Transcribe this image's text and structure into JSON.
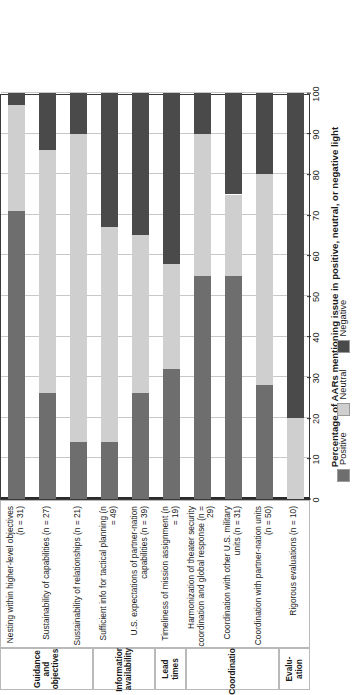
{
  "chart_data": {
    "type": "bar",
    "subtype": "stacked-horizontal-100pct",
    "title": "",
    "xlabel": "Percentage of AARs mentioning issue in positive, neutral, or negative light",
    "ylabel": "",
    "xlim": [
      0,
      100
    ],
    "xticks": [
      0,
      10,
      20,
      30,
      40,
      50,
      60,
      70,
      80,
      90,
      100
    ],
    "grid": true,
    "legend_position": "bottom",
    "categories": [
      "Nesting within higher-level objectives (n = 31)",
      "Sustainability of capabilities (n = 27)",
      "Sustainability of relationships (n = 21)",
      "Sufficient info for tactical planning (n = 49)",
      "U.S. expectations of partner-nation capabilities (n = 39)",
      "Timeliness of mission assignment (n = 19)",
      "Harmonization of theater security coordination and global response (n = 29)",
      "Coordination with other U.S. military units (n = 31)",
      "Coordination with partner-nation units (n = 50)",
      "Rigorous evaluations (n = 10)"
    ],
    "category_lines": [
      [
        "Nesting within higher-level objectives",
        "(n = 31)"
      ],
      [
        "Sustainability of capabilities (n = 27)"
      ],
      [
        "Sustainability of relationships (n = 21)"
      ],
      [
        "Sufficient info for tactical planning (n = 49)"
      ],
      [
        "U.S. expectations of partner-nation",
        "capabilities (n = 39)"
      ],
      [
        "Timeliness of mission assignment (n = 19)"
      ],
      [
        "Harmonization of theater security",
        "coordination and global response (n = 29)"
      ],
      [
        "Coordination with other U.S. military",
        "units (n = 31)"
      ],
      [
        "Coordination with partner-nation units",
        "(n = 50)"
      ],
      [
        "Rigorous evaluations (n = 10)"
      ]
    ],
    "sample_sizes": [
      31,
      27,
      21,
      49,
      39,
      19,
      29,
      31,
      50,
      10
    ],
    "series": [
      {
        "name": "Positive",
        "color": "#6e6e6e",
        "values": [
          71,
          26,
          14,
          14,
          26,
          32,
          55,
          55,
          28,
          0
        ]
      },
      {
        "name": "Neutral",
        "color": "#cfcfcf",
        "values": [
          26,
          60,
          76,
          53,
          39,
          26,
          35,
          20,
          52,
          20
        ]
      },
      {
        "name": "Negative",
        "color": "#4a4a4a",
        "values": [
          3,
          14,
          10,
          33,
          35,
          42,
          10,
          25,
          20,
          80
        ]
      }
    ],
    "groups": [
      {
        "label_lines": [
          "Guidance and",
          "objectives"
        ],
        "span": 3
      },
      {
        "label_lines": [
          "Information",
          "availability"
        ],
        "span": 2
      },
      {
        "label_lines": [
          "Lead",
          "times"
        ],
        "span": 1
      },
      {
        "label_lines": [
          "Coordination"
        ],
        "span": 3
      },
      {
        "label_lines": [
          "Evalu-",
          "ation"
        ],
        "span": 1
      }
    ]
  },
  "legend": {
    "items": [
      {
        "label": "Positive",
        "color": "#6e6e6e"
      },
      {
        "label": "Neutral",
        "color": "#cfcfcf"
      },
      {
        "label": "Negative",
        "color": "#4a4a4a"
      }
    ]
  }
}
